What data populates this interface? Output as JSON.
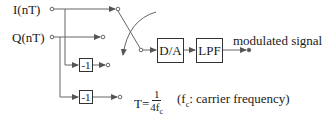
{
  "diagram": {
    "inputs": [
      {
        "label": "I(nT)"
      },
      {
        "label": "Q(nT)"
      }
    ],
    "inverters": [
      {
        "label": "-1"
      },
      {
        "label": "-1"
      }
    ],
    "blocks": [
      {
        "label": "D/A"
      },
      {
        "label": "LPF"
      }
    ],
    "output": {
      "label": "modulated signal"
    },
    "period": {
      "prefix": "T=",
      "numerator": "1",
      "denominator": "4f",
      "denominator_sub": "c"
    },
    "note": {
      "open": "(f",
      "sub": "c",
      "text": ": carrier frequency)"
    },
    "switch": {
      "type": "rotating-commutator",
      "direction": "clockwise"
    },
    "colors": {
      "line": "#555555",
      "box_border": "#333333",
      "text": "#1a1a1a"
    }
  }
}
